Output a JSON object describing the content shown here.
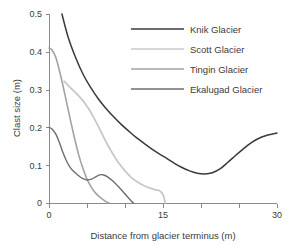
{
  "chart_data": {
    "type": "line",
    "title": "",
    "xlabel": "Distance from glacier terminus (m)",
    "ylabel": "Clast size (m)",
    "xlim": [
      0,
      30
    ],
    "ylim": [
      0,
      0.5
    ],
    "grid": false,
    "legend_position": "top-right",
    "xticks": [
      0,
      5,
      10,
      15,
      20,
      25,
      30
    ],
    "xtick_labels": [
      "0",
      "",
      "",
      "15",
      "",
      "",
      "30"
    ],
    "yticks": [
      0,
      0.1,
      0.2,
      0.3,
      0.4,
      0.5
    ],
    "ytick_labels": [
      "0",
      "0.1",
      "0.2",
      "0.3",
      "0.4",
      "0.5"
    ],
    "series": [
      {
        "name": "Knik Glacier",
        "color": "#3a3a3a",
        "width": 1.5,
        "x": [
          1.7,
          2.5,
          3.5,
          4.5,
          5.5,
          6.5,
          7.5,
          8.5,
          9.5,
          10.5,
          11.5,
          12.5,
          13.5,
          14.5,
          15.5,
          16.5,
          17.5,
          18.5,
          19.5,
          20.5,
          21.5,
          22.5,
          23.5,
          24.5,
          25.5,
          26.5,
          27.5,
          28.5,
          30
        ],
        "y": [
          0.5,
          0.44,
          0.385,
          0.34,
          0.305,
          0.275,
          0.25,
          0.228,
          0.208,
          0.19,
          0.173,
          0.158,
          0.143,
          0.13,
          0.118,
          0.105,
          0.094,
          0.085,
          0.079,
          0.077,
          0.08,
          0.09,
          0.107,
          0.125,
          0.142,
          0.158,
          0.17,
          0.178,
          0.185
        ]
      },
      {
        "name": "Scott Glacier",
        "color": "#c8c8c8",
        "width": 1.8,
        "x": [
          2.0,
          2.8,
          3.6,
          4.4,
          5.2,
          6.0,
          6.8,
          7.6,
          8.4,
          9.2,
          10.0,
          10.8,
          11.6,
          12.4,
          13.2,
          14.0,
          14.6,
          15.0,
          15.3
        ],
        "y": [
          0.322,
          0.305,
          0.29,
          0.272,
          0.25,
          0.222,
          0.19,
          0.158,
          0.13,
          0.105,
          0.085,
          0.068,
          0.056,
          0.047,
          0.04,
          0.035,
          0.032,
          0.022,
          0.0
        ]
      },
      {
        "name": "Tingin Glacier",
        "color": "#a3a3a3",
        "width": 1.6,
        "x": [
          0.0,
          0.4,
          0.9,
          1.4,
          1.9,
          2.4,
          2.9,
          3.4,
          3.9,
          4.4,
          4.9,
          5.4,
          5.9,
          6.4,
          6.9,
          7.4,
          7.9
        ],
        "y": [
          0.41,
          0.405,
          0.385,
          0.348,
          0.305,
          0.258,
          0.212,
          0.168,
          0.128,
          0.095,
          0.068,
          0.047,
          0.032,
          0.021,
          0.012,
          0.005,
          0.0
        ]
      },
      {
        "name": "Ekalugad Glacier",
        "color": "#6e6e6e",
        "width": 1.4,
        "x": [
          0.0,
          0.4,
          0.9,
          1.4,
          1.9,
          2.4,
          2.9,
          3.4,
          3.9,
          4.4,
          5.0,
          5.6,
          6.2,
          6.8,
          7.2,
          7.8,
          8.4,
          9.0,
          9.6,
          10.2,
          10.7,
          11.1
        ],
        "y": [
          0.2,
          0.196,
          0.182,
          0.158,
          0.13,
          0.107,
          0.091,
          0.081,
          0.072,
          0.065,
          0.061,
          0.063,
          0.07,
          0.075,
          0.074,
          0.068,
          0.058,
          0.046,
          0.033,
          0.019,
          0.008,
          0.0
        ]
      }
    ]
  },
  "legend": {
    "entries": [
      {
        "label": "Knik Glacier"
      },
      {
        "label": "Scott Glacier"
      },
      {
        "label": "Tingin Glacier"
      },
      {
        "label": "Ekalugad Glacier"
      }
    ]
  }
}
